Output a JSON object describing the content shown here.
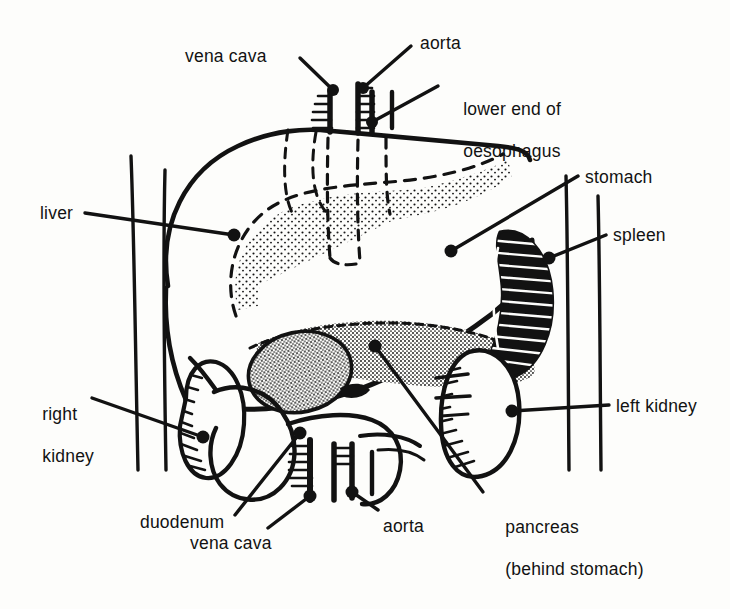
{
  "figure": {
    "domain": "anatomical-line-diagram",
    "background_color": "#fdfdfb",
    "ink_color": "#121212",
    "labels": [
      {
        "id": "vena-cava-top",
        "text": "vena cava",
        "x": 185,
        "y": 46,
        "align": "left"
      },
      {
        "id": "aorta-top",
        "text": "aorta",
        "x": 420,
        "y": 33,
        "align": "left"
      },
      {
        "id": "oesophagus",
        "text": "lower end of",
        "text2": "oesophagus",
        "x": 443,
        "y": 78,
        "align": "left"
      },
      {
        "id": "stomach",
        "text": "stomach",
        "x": 585,
        "y": 167,
        "align": "left"
      },
      {
        "id": "spleen",
        "text": "spleen",
        "x": 613,
        "y": 225,
        "align": "left"
      },
      {
        "id": "liver",
        "text": "liver",
        "x": 40,
        "y": 203,
        "align": "left"
      },
      {
        "id": "right-kidney",
        "text": "right",
        "text2": "kidney",
        "x": 22,
        "y": 383,
        "align": "left"
      },
      {
        "id": "left-kidney",
        "text": "left kidney",
        "x": 616,
        "y": 396,
        "align": "left"
      },
      {
        "id": "duodenum",
        "text": "duodenum",
        "x": 140,
        "y": 512,
        "align": "left"
      },
      {
        "id": "pancreas",
        "text": "pancreas",
        "text2": "(behind stomach)",
        "x": 485,
        "y": 496,
        "align": "left"
      },
      {
        "id": "vena-cava-bottom",
        "text": "vena cava",
        "x": 190,
        "y": 533,
        "align": "left"
      },
      {
        "id": "aorta-bottom",
        "text": "aorta",
        "x": 383,
        "y": 516,
        "align": "left"
      }
    ],
    "leader_lines": [
      {
        "id": "leader-vena-cava-top",
        "from": [
          300,
          58
        ],
        "to": [
          333,
          90
        ],
        "dot": "to"
      },
      {
        "id": "leader-aorta-top",
        "from": [
          411,
          46
        ],
        "to": [
          363,
          88
        ],
        "dot": "to"
      },
      {
        "id": "leader-oesophagus",
        "from": [
          438,
          86
        ],
        "to": [
          372,
          122
        ],
        "dot": "to"
      },
      {
        "id": "leader-stomach",
        "from": [
          578,
          176
        ],
        "to": [
          451,
          251
        ],
        "dot": "to"
      },
      {
        "id": "leader-spleen",
        "from": [
          606,
          235
        ],
        "to": [
          549,
          258
        ],
        "dot": "to"
      },
      {
        "id": "leader-liver",
        "from": [
          85,
          213
        ],
        "to": [
          234,
          235
        ],
        "dot": "to"
      },
      {
        "id": "leader-right-kidney",
        "from": [
          92,
          398
        ],
        "to": [
          203,
          437
        ],
        "dot": "to"
      },
      {
        "id": "leader-left-kidney",
        "from": [
          609,
          405
        ],
        "to": [
          512,
          411
        ],
        "dot": "to"
      },
      {
        "id": "leader-duodenum",
        "from": [
          235,
          515
        ],
        "to": [
          300,
          433
        ],
        "dot": "to"
      },
      {
        "id": "leader-pancreas",
        "from": [
          483,
          492
        ],
        "to": [
          375,
          346
        ],
        "dot": "to"
      },
      {
        "id": "leader-vena-cava-bottom",
        "from": [
          268,
          528
        ],
        "to": [
          310,
          496
        ],
        "dot": "to"
      },
      {
        "id": "leader-aorta-bottom",
        "from": [
          378,
          510
        ],
        "to": [
          352,
          492
        ],
        "dot": "to"
      }
    ],
    "organs": [
      {
        "id": "liver",
        "name": "liver",
        "style": "outline"
      },
      {
        "id": "stomach",
        "name": "stomach",
        "style": "dashed-outline-stippled"
      },
      {
        "id": "pancreas",
        "name": "pancreas",
        "style": "stippled"
      },
      {
        "id": "spleen",
        "name": "spleen",
        "style": "solid-dark-hatched"
      },
      {
        "id": "duodenum",
        "name": "duodenum",
        "style": "outline"
      },
      {
        "id": "right-kidney",
        "name": "right kidney",
        "style": "outline-hatched"
      },
      {
        "id": "left-kidney",
        "name": "left kidney",
        "style": "outline-hatched"
      },
      {
        "id": "vena-cava",
        "name": "vena cava",
        "style": "vessel"
      },
      {
        "id": "aorta",
        "name": "aorta",
        "style": "vessel"
      },
      {
        "id": "oesophagus",
        "name": "lower end of oesophagus",
        "style": "vessel"
      }
    ]
  }
}
